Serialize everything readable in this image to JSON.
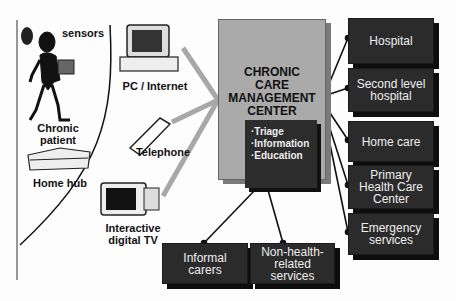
{
  "diagram": {
    "center": {
      "title_lines": [
        "CHRONIC",
        "CARE",
        "MANAGEMENT",
        "CENTER"
      ],
      "functions": [
        "·Triage",
        "·Information",
        "·Education"
      ]
    },
    "patient_side": {
      "sensors_label": "sensors",
      "patient_label": [
        "Chronic",
        "patient"
      ],
      "hub_label": "Home hub"
    },
    "channels": [
      {
        "label": "PC / Internet"
      },
      {
        "label": "Telephone"
      },
      {
        "label": [
          "Interactive",
          "digital TV"
        ]
      }
    ],
    "services_right": [
      {
        "label": [
          "Hospital"
        ]
      },
      {
        "label": [
          "Second level",
          "hospital"
        ]
      },
      {
        "label": [
          "Home care"
        ]
      },
      {
        "label": [
          "Primary",
          "Health Care",
          "Center"
        ]
      },
      {
        "label": [
          "Emergency",
          "services"
        ]
      }
    ],
    "services_bottom": [
      {
        "label": [
          "Informal",
          "carers"
        ]
      },
      {
        "label": [
          "Non-health-",
          "related",
          "services"
        ]
      }
    ],
    "colors": {
      "box": "#2b2b2b",
      "center": "#aaaaaa",
      "channel_line": "#a8a8a8",
      "connector": "#111111"
    }
  }
}
